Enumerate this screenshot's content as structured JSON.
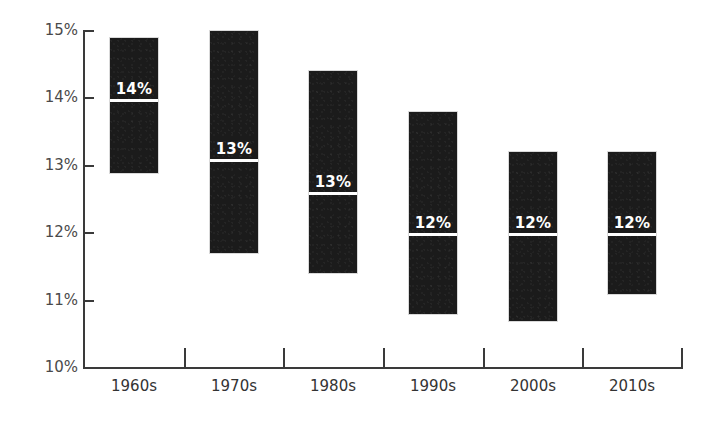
{
  "chart_data": {
    "type": "bar",
    "title": "",
    "subtitle": "",
    "xlabel": "",
    "ylabel": "",
    "grid": false,
    "legend": "none",
    "orientation": "vertical",
    "bar_style": "floating-range",
    "ylim": [
      10,
      15
    ],
    "yticks": [
      10,
      11,
      12,
      13,
      14,
      15
    ],
    "ytick_labels": [
      "10%",
      "11%",
      "12%",
      "13%",
      "14%",
      "15%"
    ],
    "categories": [
      "1960s",
      "1970s",
      "1980s",
      "1990s",
      "2000s",
      "2010s"
    ],
    "series": [
      {
        "name": "range-low",
        "values": [
          12.9,
          11.7,
          11.4,
          10.8,
          10.7,
          11.1
        ]
      },
      {
        "name": "range-high",
        "values": [
          14.9,
          15.0,
          14.4,
          13.8,
          13.2,
          13.2
        ]
      },
      {
        "name": "marker-value",
        "values": [
          14.0,
          13.1,
          12.6,
          12.0,
          12.0,
          12.0
        ]
      }
    ],
    "data_labels": [
      "14%",
      "13%",
      "13%",
      "12%",
      "12%",
      "12%"
    ],
    "colors": {
      "bar": "#1b1b1b",
      "marker": "#ffffff",
      "axis": "#3a3a3a",
      "tick_label": "#4a4a4a",
      "category_label": "#333333",
      "background": "#ffffff"
    }
  }
}
